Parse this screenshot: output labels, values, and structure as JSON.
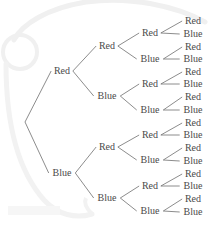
{
  "diagram": {
    "type": "binary-probability-tree",
    "title": "",
    "depth": 4,
    "branch_labels": [
      "Red",
      "Blue"
    ],
    "colors": {
      "text": "#4a4a4a",
      "edge": "#6e6e6e",
      "background": "#ffffff",
      "watermark": "#f1f1f1"
    },
    "root": {
      "label": "",
      "x": 25,
      "y": 122
    },
    "levels": [
      {
        "level": 1,
        "count": 2,
        "x": 62,
        "nodes": [
          {
            "label": "Red",
            "y": 71
          },
          {
            "label": "Blue",
            "y": 173
          }
        ]
      },
      {
        "level": 2,
        "count": 4,
        "x": 107,
        "nodes": [
          {
            "label": "Red",
            "y": 46
          },
          {
            "label": "Blue",
            "y": 96
          },
          {
            "label": "Red",
            "y": 147
          },
          {
            "label": "Blue",
            "y": 198
          }
        ]
      },
      {
        "level": 3,
        "count": 8,
        "x": 150,
        "nodes": [
          {
            "label": "Red",
            "y": 33
          },
          {
            "label": "Blue",
            "y": 59
          },
          {
            "label": "Red",
            "y": 84
          },
          {
            "label": "Blue",
            "y": 110
          },
          {
            "label": "Red",
            "y": 135
          },
          {
            "label": "Blue",
            "y": 160
          },
          {
            "label": "Red",
            "y": 186
          },
          {
            "label": "Blue",
            "y": 211
          }
        ]
      },
      {
        "level": 4,
        "count": 16,
        "x": 193,
        "nodes": [
          {
            "label": "Red",
            "y": 21
          },
          {
            "label": "Blue",
            "y": 34
          },
          {
            "label": "Red",
            "y": 47
          },
          {
            "label": "Blue",
            "y": 59
          },
          {
            "label": "Red",
            "y": 72
          },
          {
            "label": "Blue",
            "y": 84
          },
          {
            "label": "Red",
            "y": 97
          },
          {
            "label": "Blue",
            "y": 110
          },
          {
            "label": "Red",
            "y": 123
          },
          {
            "label": "Blue",
            "y": 135
          },
          {
            "label": "Red",
            "y": 148
          },
          {
            "label": "Blue",
            "y": 161
          },
          {
            "label": "Red",
            "y": 174
          },
          {
            "label": "Blue",
            "y": 186
          },
          {
            "label": "Red",
            "y": 199
          },
          {
            "label": "Blue",
            "y": 212
          }
        ]
      }
    ]
  }
}
